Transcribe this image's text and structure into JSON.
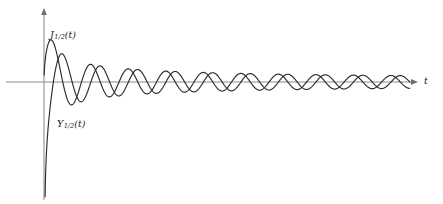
{
  "figure": {
    "background_color": "#ffffff",
    "width": 443,
    "height": 204
  },
  "axes": {
    "origin_x": 44,
    "origin_y": 82,
    "t_axis_label": "t",
    "t_axis_start_x": 6,
    "t_axis_end_x": 418,
    "v_axis_top_y": 8,
    "v_axis_bottom_y": 200,
    "axis_color": "#8c8c8c",
    "arrow_color": "#6f6f6f",
    "x_units_per_px": 0.1675,
    "y_px_per_unit": 62
  },
  "labels": {
    "j_curve": {
      "name": "J",
      "subscript": "1/2",
      "argument": "(t)",
      "x": 50,
      "y": 30
    },
    "y_curve": {
      "name": "Y",
      "subscript": "1/2",
      "argument": "(t)",
      "x": 57,
      "y": 119
    },
    "t_axis": {
      "text": "t",
      "x": 424,
      "y": 76
    }
  },
  "chart_data": {
    "type": "line",
    "title": "",
    "xlabel": "t",
    "ylabel": "",
    "grid": false,
    "legend": "inline-annotations",
    "xlim": [
      0,
      62.5
    ],
    "ylim": [
      -1.95,
      1.1
    ],
    "annotations": [
      {
        "text": "J_{1/2}(t)",
        "t": 5.7,
        "value": 0.72
      },
      {
        "text": "Y_{1/2}(t)",
        "t": 6.9,
        "value": -0.6
      }
    ],
    "series": [
      {
        "name": "J_{1/2}(t)",
        "color": "#2b2b2b",
        "formula": "sqrt(2/(pi*t))*sin(t)",
        "t_start": 0.02,
        "t_end": 62.2,
        "samples": 1400,
        "first_max": {
          "t": 2.0,
          "value": 0.72
        },
        "zeros": [
          3.1416,
          6.2832,
          9.4248,
          12.566,
          15.708,
          18.85,
          21.991,
          25.133,
          28.274,
          31.416,
          34.558,
          37.699,
          40.841,
          43.982,
          47.124,
          50.265,
          53.407,
          56.549,
          59.69
        ],
        "extrema_values": [
          0.72,
          -0.32,
          0.245,
          -0.205,
          0.18,
          -0.162,
          0.15,
          -0.14,
          0.132,
          -0.125,
          0.119,
          -0.114,
          0.11,
          -0.106,
          0.103,
          -0.1,
          0.097,
          -0.094,
          0.092
        ]
      },
      {
        "name": "Y_{1/2}(t)",
        "color": "#2b2b2b",
        "formula": "-sqrt(2/(pi*t))*cos(t)",
        "t_start": 0.18,
        "t_end": 62.2,
        "samples": 1400,
        "start_value": -1.93,
        "zeros": [
          1.5708,
          4.7124,
          7.854,
          10.996,
          14.137,
          17.279,
          20.42,
          23.562,
          26.704,
          29.845,
          32.987,
          36.128,
          39.27,
          42.412,
          45.553,
          48.695,
          51.836,
          54.978,
          58.119,
          61.261
        ],
        "extrema_values": [
          -1.93,
          0.42,
          -0.28,
          0.22,
          -0.19,
          0.17,
          -0.155,
          0.145,
          -0.136,
          0.128,
          -0.122,
          0.117,
          -0.112,
          0.108,
          -0.104,
          0.101,
          -0.098,
          0.095,
          -0.093
        ]
      }
    ]
  }
}
